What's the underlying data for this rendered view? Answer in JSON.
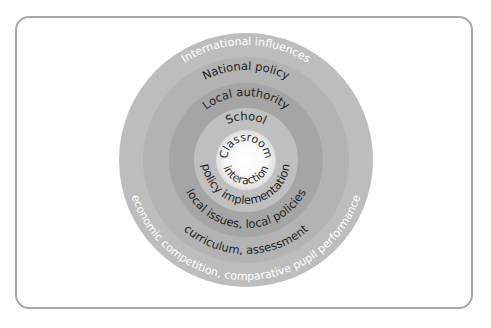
{
  "diagram": {
    "type": "concentric-circles",
    "rings": [
      {
        "level": "International influences",
        "detail": "economic competition, comparative pupil performance",
        "color": "#bdbdbd",
        "text_color": "#ffffff"
      },
      {
        "level": "National policy",
        "detail": "curriculum, assessment",
        "color": "#b3b3b3",
        "text_color": "#1e1e1e"
      },
      {
        "level": "Local authority",
        "detail": "local issues, local policies",
        "color": "#a5a5a5",
        "text_color": "#1e1e1e"
      },
      {
        "level": "School",
        "detail": "policy implementation",
        "color": "#bfbfbf",
        "text_color": "#1e1e1e"
      },
      {
        "level": "Classroom",
        "detail": "interaction",
        "color": "#f4f4f4",
        "text_color": "#2a2a2a"
      }
    ],
    "frame_color": "#a8a8a8"
  }
}
